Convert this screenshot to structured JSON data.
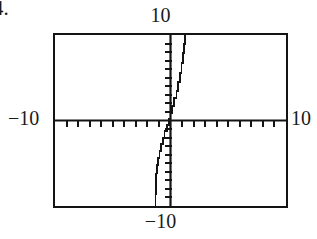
{
  "item": {
    "number_label": "4."
  },
  "figure": {
    "kind": "graphing-calculator-screen",
    "title": "",
    "frame": {
      "left": 53,
      "top": 33,
      "width": 235,
      "height": 175,
      "border_color": "#141414",
      "background": "#ffffff"
    },
    "labels": {
      "top": "10",
      "bottom": "−10",
      "left": "−10",
      "right": "10"
    }
  },
  "chart_data": {
    "type": "line",
    "title": "",
    "xlabel": "",
    "ylabel": "",
    "xlim": [
      -10,
      10
    ],
    "ylim": [
      -10,
      10
    ],
    "grid": false,
    "legend": null,
    "axes": {
      "x_axis_at_y": 0,
      "y_axis_at_x": 0,
      "tick_interval_x": 1,
      "tick_interval_y": 1,
      "tick_count_x": 20,
      "tick_count_y": 20,
      "tick_style": "hash-marks",
      "line_color": "#141414"
    },
    "series": [
      {
        "name": "curve",
        "shape": "cubic-odd-increasing",
        "color": "#141414",
        "render": "pixelated-steps",
        "x": [
          -1.3,
          -1.28,
          -1.22,
          -1.15,
          -1.05,
          -0.95,
          -0.82,
          -0.68,
          -0.52,
          -0.34,
          -0.16,
          0.0,
          0.16,
          0.34,
          0.52,
          0.68,
          0.82,
          0.95,
          1.05,
          1.15,
          1.22,
          1.28,
          1.3
        ],
        "y": [
          -10.0,
          -8.6,
          -7.3,
          -6.2,
          -5.2,
          -4.4,
          -3.6,
          -2.8,
          -2.0,
          -1.2,
          -0.5,
          0.2,
          0.9,
          1.7,
          2.6,
          3.5,
          4.5,
          5.6,
          6.7,
          7.9,
          9.0,
          9.7,
          10.0
        ]
      }
    ]
  }
}
